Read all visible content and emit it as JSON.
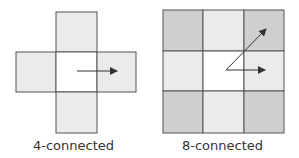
{
  "diagrams": [
    {
      "name": "4-connected",
      "label": "4-connected",
      "neighbors": [
        "up",
        "down",
        "left",
        "right"
      ]
    },
    {
      "name": "8-connected",
      "label": "8-connected",
      "neighbors": [
        "up",
        "down",
        "left",
        "right",
        "up-left",
        "up-right",
        "down-left",
        "down-right"
      ]
    }
  ],
  "colors": {
    "edge_neighbor": "#ebebeb",
    "corner_neighbor": "#cfcfcf",
    "center": "#ffffff",
    "border": "#555555",
    "arrow": "#333333"
  }
}
